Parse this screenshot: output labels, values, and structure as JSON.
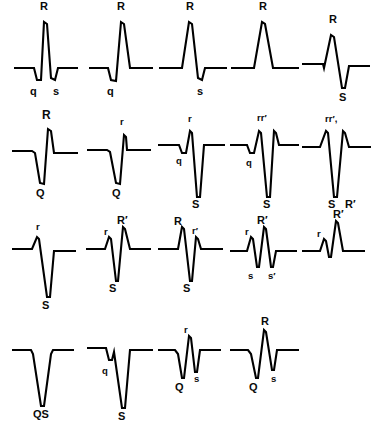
{
  "figure": {
    "stroke_color": "#000000",
    "background_color": "#ffffff",
    "rows": 4,
    "columns": 5
  },
  "waveforms": [
    {
      "id": "r1c1",
      "labels": [
        {
          "text": "R",
          "pos": "above",
          "style": "up"
        },
        {
          "text": "q",
          "pos": "below-left",
          "style": "down"
        },
        {
          "text": "s",
          "pos": "below-right",
          "style": "down"
        }
      ]
    },
    {
      "id": "r1c2",
      "labels": [
        {
          "text": "R",
          "pos": "above",
          "style": "up"
        },
        {
          "text": "q",
          "pos": "below-left",
          "style": "down"
        }
      ]
    },
    {
      "id": "r1c3",
      "labels": [
        {
          "text": "R",
          "pos": "above",
          "style": "up"
        },
        {
          "text": "s",
          "pos": "below-right",
          "style": "down"
        }
      ]
    },
    {
      "id": "r1c4",
      "labels": [
        {
          "text": "R",
          "pos": "above",
          "style": "up"
        }
      ]
    },
    {
      "id": "r1c5",
      "labels": [
        {
          "text": "R",
          "pos": "above",
          "style": "up"
        },
        {
          "text": "S",
          "pos": "below-right",
          "style": "down"
        }
      ]
    },
    {
      "id": "r2c1",
      "labels": [
        {
          "text": "R",
          "pos": "above",
          "style": "big"
        },
        {
          "text": "Q",
          "pos": "below-left",
          "style": "down"
        }
      ]
    },
    {
      "id": "r2c2",
      "labels": [
        {
          "text": "r",
          "pos": "above",
          "style": "small"
        },
        {
          "text": "Q",
          "pos": "below-left",
          "style": "down"
        }
      ]
    },
    {
      "id": "r2c3",
      "labels": [
        {
          "text": "r",
          "pos": "above",
          "style": "small"
        },
        {
          "text": "q",
          "pos": "mid-left",
          "style": "small"
        },
        {
          "text": "S",
          "pos": "below",
          "style": "down"
        }
      ]
    },
    {
      "id": "r2c4",
      "labels": [
        {
          "text": "rr′",
          "pos": "above",
          "style": "small"
        },
        {
          "text": "q",
          "pos": "mid-left",
          "style": "small"
        },
        {
          "text": "S",
          "pos": "below",
          "style": "down"
        }
      ]
    },
    {
      "id": "r2c5",
      "labels": [
        {
          "text": "rr′,",
          "pos": "above",
          "style": "small"
        },
        {
          "text": "S",
          "pos": "below-left",
          "style": "down"
        },
        {
          "text": "R′",
          "pos": "below-right",
          "style": "down"
        }
      ]
    },
    {
      "id": "r3c1",
      "labels": [
        {
          "text": "r",
          "pos": "above",
          "style": "small"
        },
        {
          "text": "S",
          "pos": "below",
          "style": "down"
        }
      ]
    },
    {
      "id": "r3c2",
      "labels": [
        {
          "text": "r",
          "pos": "above-left",
          "style": "small"
        },
        {
          "text": "R′",
          "pos": "above-right",
          "style": "up"
        },
        {
          "text": "S",
          "pos": "below-left",
          "style": "down"
        }
      ]
    },
    {
      "id": "r3c3",
      "labels": [
        {
          "text": "R",
          "pos": "above-left",
          "style": "up"
        },
        {
          "text": "r′",
          "pos": "above-right",
          "style": "small"
        },
        {
          "text": "S",
          "pos": "below",
          "style": "down"
        }
      ]
    },
    {
      "id": "r3c4",
      "labels": [
        {
          "text": "r",
          "pos": "above-left",
          "style": "small"
        },
        {
          "text": "R′",
          "pos": "above-right",
          "style": "up"
        },
        {
          "text": "s",
          "pos": "below-left",
          "style": "small"
        },
        {
          "text": "s′",
          "pos": "below-right",
          "style": "small"
        }
      ]
    },
    {
      "id": "r3c5",
      "labels": [
        {
          "text": "r",
          "pos": "above-left",
          "style": "small"
        },
        {
          "text": "R′",
          "pos": "above-right",
          "style": "up"
        }
      ]
    },
    {
      "id": "r4c1",
      "labels": [
        {
          "text": "QS",
          "pos": "below",
          "style": "down"
        }
      ]
    },
    {
      "id": "r4c2",
      "labels": [
        {
          "text": "q",
          "pos": "mid-left",
          "style": "small"
        },
        {
          "text": "S",
          "pos": "below",
          "style": "down"
        }
      ]
    },
    {
      "id": "r4c3",
      "labels": [
        {
          "text": "r",
          "pos": "above",
          "style": "small"
        },
        {
          "text": "Q",
          "pos": "below-left",
          "style": "down"
        },
        {
          "text": "s",
          "pos": "below-right",
          "style": "small"
        }
      ]
    },
    {
      "id": "r4c4",
      "labels": [
        {
          "text": "R",
          "pos": "above",
          "style": "up"
        },
        {
          "text": "Q",
          "pos": "below-left",
          "style": "down"
        },
        {
          "text": "s",
          "pos": "below-right",
          "style": "small"
        }
      ]
    }
  ]
}
